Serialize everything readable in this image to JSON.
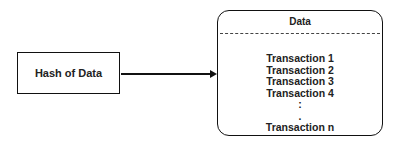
{
  "hash_box": {
    "label": "Hash of Data"
  },
  "data_box": {
    "title": "Data",
    "items": [
      "Transaction 1",
      "Transaction 2",
      "Transaction 3",
      "Transaction 4",
      ":",
      ".",
      "Transaction n"
    ]
  },
  "connector": {
    "from": "hash_box",
    "to": "data_box",
    "style": "arrow"
  }
}
